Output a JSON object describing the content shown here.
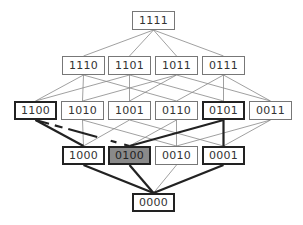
{
  "diagram": {
    "type": "hasse-lattice",
    "box_w": 43,
    "box_h": 19,
    "nodes": [
      {
        "id": "1111",
        "label": "1111",
        "x": 132,
        "y": 11,
        "style": "thin"
      },
      {
        "id": "1110",
        "label": "1110",
        "x": 62,
        "y": 56,
        "style": "thin"
      },
      {
        "id": "1101",
        "label": "1101",
        "x": 108,
        "y": 56,
        "style": "thin"
      },
      {
        "id": "1011",
        "label": "1011",
        "x": 155,
        "y": 56,
        "style": "thin"
      },
      {
        "id": "0111",
        "label": "0111",
        "x": 202,
        "y": 56,
        "style": "thin"
      },
      {
        "id": "1100",
        "label": "1100",
        "x": 14,
        "y": 101,
        "style": "thick"
      },
      {
        "id": "1010",
        "label": "1010",
        "x": 61,
        "y": 101,
        "style": "thin"
      },
      {
        "id": "1001",
        "label": "1001",
        "x": 108,
        "y": 101,
        "style": "thin"
      },
      {
        "id": "0110",
        "label": "0110",
        "x": 155,
        "y": 101,
        "style": "thin"
      },
      {
        "id": "0101",
        "label": "0101",
        "x": 202,
        "y": 101,
        "style": "thick"
      },
      {
        "id": "0011",
        "label": "0011",
        "x": 249,
        "y": 101,
        "style": "thin"
      },
      {
        "id": "1000",
        "label": "1000",
        "x": 62,
        "y": 146,
        "style": "thick"
      },
      {
        "id": "0100",
        "label": "0100",
        "x": 108,
        "y": 146,
        "style": "thick fill"
      },
      {
        "id": "0010",
        "label": "0010",
        "x": 155,
        "y": 146,
        "style": "thin"
      },
      {
        "id": "0001",
        "label": "0001",
        "x": 202,
        "y": 146,
        "style": "thick"
      },
      {
        "id": "0000",
        "label": "0000",
        "x": 132,
        "y": 193,
        "style": "thick"
      }
    ],
    "thick_edges": [
      [
        "1100",
        "1000"
      ],
      [
        "1100",
        "0100"
      ],
      [
        "0101",
        "0100"
      ],
      [
        "0101",
        "0001"
      ],
      [
        "1000",
        "0000"
      ],
      [
        "0100",
        "0000"
      ],
      [
        "0001",
        "0000"
      ]
    ],
    "colors": {
      "thin": "#888888",
      "thick": "#222222",
      "highlight_fill": "#8a8a8a"
    }
  }
}
